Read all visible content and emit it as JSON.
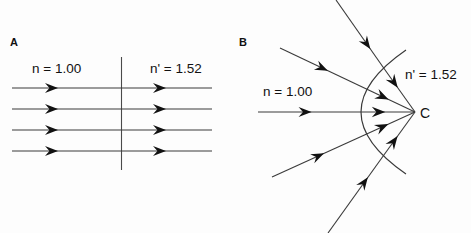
{
  "figure": {
    "background_color": "#fdfdfd",
    "ink_color": "#111111",
    "line_color": "#3a3a3a",
    "width": 471,
    "height": 233
  },
  "panels": [
    {
      "id": "A",
      "letter": "A",
      "letter_x": 10,
      "letter_y": 46,
      "description": "Plane refracting surface with parallel rays",
      "incident_medium_label": "n = 1.00",
      "incident_medium_label_x": 32,
      "incident_medium_label_y": 73,
      "refracting_medium_label": "n' = 1.52",
      "refracting_medium_label_x": 150,
      "refracting_medium_label_y": 73,
      "surface": {
        "type": "vertical-line",
        "x": 121.5,
        "y_top": 57,
        "y_bottom": 170
      },
      "rays": [
        {
          "y": 88,
          "x_start": 12,
          "x_end": 212,
          "arrow1_x": 58,
          "arrow2_x": 166
        },
        {
          "y": 109,
          "x_start": 12,
          "x_end": 212,
          "arrow1_x": 58,
          "arrow2_x": 166
        },
        {
          "y": 130,
          "x_start": 12,
          "x_end": 212,
          "arrow1_x": 58,
          "arrow2_x": 166
        },
        {
          "y": 151,
          "x_start": 12,
          "x_end": 212,
          "arrow1_x": 58,
          "arrow2_x": 166
        }
      ]
    },
    {
      "id": "B",
      "letter": "B",
      "letter_x": 239,
      "letter_y": 46,
      "description": "Convex refracting surface converging rays to point C",
      "incident_medium_label": "n = 1.00",
      "incident_medium_label_x": 263,
      "incident_medium_label_y": 96,
      "refracting_medium_label": "n' = 1.52",
      "refracting_medium_label_x": 405,
      "refracting_medium_label_y": 79,
      "center_point_label": "C",
      "center_point_label_x": 420,
      "center_point_label_y": 118,
      "convergence_point": {
        "x": 415,
        "y": 112
      },
      "surface": {
        "type": "arc",
        "left_vertex_x": 368,
        "vertex_y": 112,
        "top_end_x": 406,
        "top_end_y": 50,
        "bottom_end_x": 406,
        "bottom_end_y": 174
      },
      "rays": [
        {
          "x_start": 336,
          "y_start": 0,
          "arrow_t": 0.72,
          "label": "ray-upper-steep"
        },
        {
          "x_start": 280,
          "y_start": 48,
          "arrow_t": 0.55,
          "label": "ray-upper-shallow"
        },
        {
          "x_start": 258,
          "y_start": 112,
          "arrow_t": 0.52,
          "label": "ray-axial"
        },
        {
          "x_start": 272,
          "y_start": 177,
          "arrow_t": 0.55,
          "label": "ray-lower-shallow"
        },
        {
          "x_start": 328,
          "y_start": 233,
          "arrow_t": 0.72,
          "label": "ray-lower-steep"
        }
      ],
      "internal_rays": [
        {
          "entry_x": 401,
          "entry_y": 73,
          "arrow_t": 0.45
        },
        {
          "entry_x": 381,
          "entry_y": 89,
          "arrow_t": 0.45
        },
        {
          "entry_x": 368,
          "entry_y": 112,
          "arrow_t": 0.45
        },
        {
          "entry_x": 381,
          "entry_y": 135,
          "arrow_t": 0.45
        },
        {
          "entry_x": 401,
          "entry_y": 152,
          "arrow_t": 0.45
        }
      ]
    }
  ]
}
